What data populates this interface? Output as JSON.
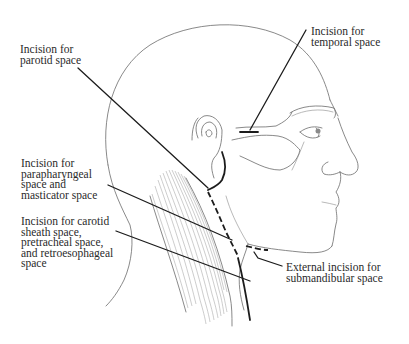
{
  "figure": {
    "colors": {
      "background": "#ffffff",
      "outline": "#6b6b6b",
      "leader_and_incision": "#1c1c1c",
      "text": "#2a2a2a"
    }
  },
  "labels": {
    "parotid": {
      "lines": [
        "Incision for",
        "parotid space"
      ]
    },
    "temporal": {
      "lines": [
        "Incision for",
        "temporal space"
      ]
    },
    "parapharyngeal": {
      "lines": [
        "Incision for",
        "parapharyngeal",
        "space and",
        "masticator space"
      ]
    },
    "carotid": {
      "lines": [
        "Incision for carotid",
        "sheath space,",
        "pretracheal space,",
        "and retroesophageal",
        "space"
      ]
    },
    "submandibular": {
      "lines": [
        "External incision for",
        "submandibular space"
      ]
    }
  }
}
